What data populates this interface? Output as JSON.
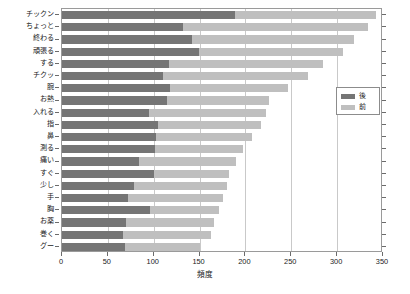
{
  "chart_data": {
    "type": "bar",
    "orientation": "horizontal",
    "stacked": true,
    "title": "",
    "xlabel": "頻度",
    "ylabel": "",
    "xlim": [
      0,
      350
    ],
    "xticks": [
      0,
      50,
      100,
      150,
      200,
      250,
      300,
      350
    ],
    "grid": true,
    "legend_position": "right",
    "categories": [
      "チックン",
      "ちょっと",
      "終わる",
      "頑張る",
      "する",
      "チクッ",
      "腕",
      "お熱",
      "入れる",
      "指",
      "鼻",
      "測る",
      "痛い",
      "すぐ",
      "少し",
      "手",
      "胸",
      "お薬",
      "巻く",
      "グー"
    ],
    "series": [
      {
        "name": "後",
        "color": "#757575",
        "values": [
          189,
          132,
          142,
          149,
          117,
          110,
          118,
          114,
          95,
          105,
          103,
          101,
          84,
          100,
          78,
          72,
          96,
          70,
          66,
          69
        ]
      },
      {
        "name": "前",
        "color": "#bfbfbf",
        "values": [
          153,
          202,
          176,
          157,
          168,
          158,
          128,
          112,
          127,
          112,
          104,
          96,
          106,
          82,
          102,
          104,
          75,
          96,
          96,
          81
        ]
      }
    ],
    "totals": [
      342,
      334,
      318,
      306,
      285,
      268,
      246,
      226,
      222,
      217,
      207,
      197,
      190,
      182,
      180,
      176,
      171,
      166,
      162,
      150
    ]
  },
  "legend": {
    "entries": [
      {
        "label": "後",
        "swatch": "#757575"
      },
      {
        "label": "前",
        "swatch": "#bfbfbf"
      }
    ]
  },
  "axis": {
    "x_title": "頻度",
    "x_tick_labels": [
      "0",
      "50",
      "100",
      "150",
      "200",
      "250",
      "300",
      "350"
    ]
  }
}
